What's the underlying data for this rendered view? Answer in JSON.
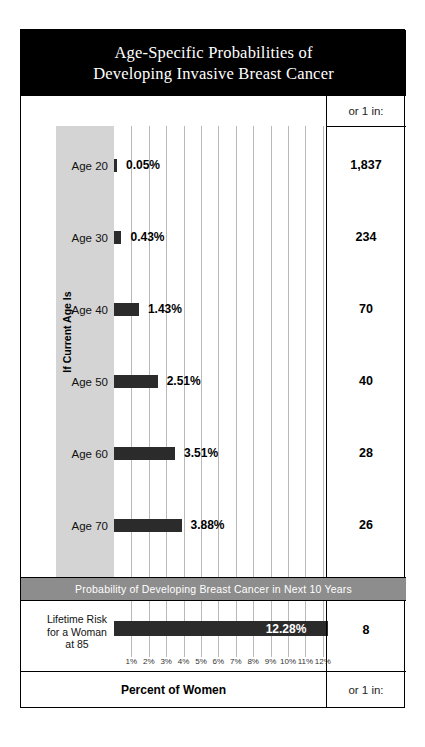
{
  "title": {
    "line1": "Age-Specific Probabilities of",
    "line2": "Developing Invasive Breast Cancer"
  },
  "header": {
    "or_one_in": "or 1 in:"
  },
  "axis": {
    "vertical_label": "If Current Age Is",
    "bottom_label": "Percent of Women",
    "bottom_or_one_in": "or 1 in:"
  },
  "banner": {
    "text": "Probability of Developing Breast Cancer in Next 10 Years"
  },
  "lifetime": {
    "label_line1": "Lifetime Risk",
    "label_line2": "for a Woman",
    "label_line3": "at 85",
    "percent": "12.28%",
    "or_one_in": "8"
  },
  "colors": {
    "title_bg": "#000000",
    "bar": "#2b2b2b",
    "band": "#d4d4d4",
    "banner": "#8d8d8d",
    "gridline": "#b9b9b9"
  },
  "chart_data": {
    "type": "bar",
    "title": "Age-Specific Probabilities of Developing Invasive Breast Cancer",
    "subtitle": "Probability of Developing Breast Cancer in Next 10 Years",
    "orientation": "horizontal",
    "xlabel": "Percent of Women",
    "ylabel": "If Current Age Is",
    "xlim": [
      0,
      12.8
    ],
    "grid": true,
    "legend": "none",
    "categories": [
      "Age 20",
      "Age 30",
      "Age 40",
      "Age 50",
      "Age 60",
      "Age 70"
    ],
    "values": [
      0.05,
      0.43,
      1.43,
      2.51,
      3.51,
      3.88
    ],
    "value_labels": [
      "0.05%",
      "0.43%",
      "1.43%",
      "2.51%",
      "3.51%",
      "3.88%"
    ],
    "or_one_in": [
      "1,837",
      "234",
      "70",
      "40",
      "28",
      "26"
    ],
    "tick_labels": [
      "1%",
      "2%",
      "3%",
      "4%",
      "5%",
      "6%",
      "7%",
      "8%",
      "9%",
      "10%",
      "11%",
      "12%"
    ],
    "tick_values": [
      1,
      2,
      3,
      4,
      5,
      6,
      7,
      8,
      9,
      10,
      11,
      12
    ],
    "lifetime_row": {
      "category": "Lifetime Risk for a Woman at 85",
      "value": 12.28,
      "value_label": "12.28%",
      "or_one_in": "8"
    }
  }
}
